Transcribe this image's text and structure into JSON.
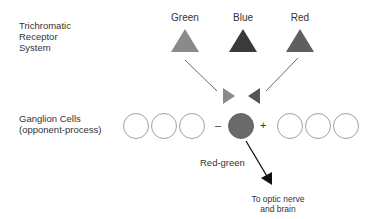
{
  "title_left": {
    "receptor_line1": "Trichromatic",
    "receptor_line2": "Receptor",
    "receptor_line3": "System",
    "ganglion_line1": "Ganglion Cells",
    "ganglion_line2": "(opponent-process)"
  },
  "receptors": [
    {
      "label": "Green",
      "color": "#8a8a8a"
    },
    {
      "label": "Blue",
      "color": "#3a3a3a"
    },
    {
      "label": "Red",
      "color": "#5f5f5f"
    }
  ],
  "signs": {
    "minus": "–",
    "plus": "+"
  },
  "ganglion_active_color": "#6a6a6a",
  "output": {
    "channel_label": "Red-green",
    "destination_line1": "To optic nerve",
    "destination_line2": "and brain"
  }
}
